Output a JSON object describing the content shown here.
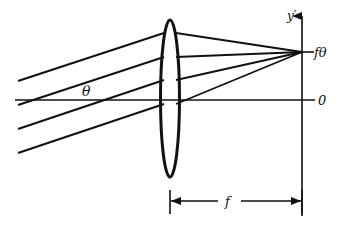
{
  "diagram": {
    "title": "",
    "type": "optics-lens-focal-plane",
    "colors": {
      "ink": "#111111",
      "background": "#ffffff"
    },
    "labels": {
      "angle": "θ",
      "y_axis": "y′",
      "image_height": "fθ",
      "origin": "0",
      "focal_length": "f"
    },
    "elements": {
      "lens": {
        "cx": 170,
        "top": 20,
        "bottom": 177,
        "half_width": 10
      },
      "optical_axis": {
        "y": 100,
        "x_start": 15,
        "x_end": 315
      },
      "focal_plane": {
        "x": 302,
        "y_top": 14,
        "y_bottom": 216
      },
      "focal_point": {
        "x": 302,
        "y": 52
      },
      "incoming_rays": [
        {
          "x0": 18,
          "y0": 81,
          "x1": 163,
          "y1": 33
        },
        {
          "x0": 18,
          "y0": 105,
          "x1": 163,
          "y1": 57
        },
        {
          "x0": 18,
          "y0": 129,
          "x1": 163,
          "y1": 80
        },
        {
          "x0": 18,
          "y0": 153,
          "x1": 163,
          "y1": 104
        }
      ],
      "refracted_rays": [
        {
          "x0": 177,
          "y0": 33
        },
        {
          "x0": 177,
          "y0": 57
        },
        {
          "x0": 177,
          "y0": 80
        },
        {
          "x0": 177,
          "y0": 104
        }
      ],
      "dimension_f": {
        "y": 201,
        "x_start": 170,
        "x_end": 302
      }
    }
  }
}
